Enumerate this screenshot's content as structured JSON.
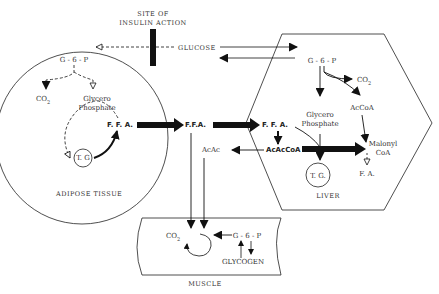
{
  "header": {
    "top_text": ""
  },
  "insulin": {
    "line1": "SITE OF",
    "line2": "INSULIN ACTION"
  },
  "compartments": {
    "adipose": "ADIPOSE TISSUE",
    "liver": "LIVER",
    "muscle": "MUSCLE"
  },
  "adipose": {
    "g6p": "G - 6 - P",
    "co2": "CO",
    "co2_sub": "2",
    "glycero1": "Glycero",
    "glycero2": "Phosphate",
    "tg": "T. G",
    "ffa": "F. F. A."
  },
  "blood": {
    "glucose": "GLUCOSE",
    "ffa": "F.F.A.",
    "acac": "AcAc"
  },
  "liver": {
    "g6p": "G - 6 - P",
    "co2": "CO",
    "co2_sub": "2",
    "accoa": "AcCoA",
    "glycero1": "Glycero",
    "glycero2": "Phosphate",
    "ffa": "F. F. A.",
    "acaccoa": "AcAcCoA",
    "malonyl1": "Malonyl",
    "malonyl2": "CoA",
    "fa": "F. A.",
    "tg": "T. G."
  },
  "muscle": {
    "co2": "CO",
    "co2_sub": "2",
    "g6p": "G - 6 - P",
    "glycogen": "GLYCOGEN"
  }
}
